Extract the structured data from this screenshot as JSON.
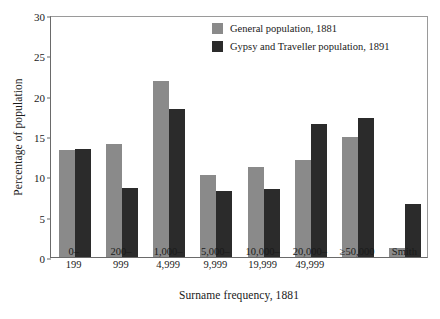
{
  "chart_data": {
    "type": "bar",
    "title": "",
    "xlabel": "Surname frequency, 1881",
    "ylabel": "Percentage of population",
    "ylim": [
      0,
      30
    ],
    "yticks": [
      "0",
      "5",
      "10",
      "15",
      "20",
      "25",
      "30"
    ],
    "grid": false,
    "legend_position": "top-right",
    "categories": [
      "0–\n199",
      "200–\n999",
      "1,000–\n4,999",
      "5,000–\n9,999",
      "10,000–\n19,999",
      "20,000–\n49,999",
      "≥50,000",
      "Smith"
    ],
    "series": [
      {
        "name": "General population, 1881",
        "color": "#8a8a8a",
        "values": [
          13.3,
          14.0,
          21.8,
          10.2,
          11.1,
          12.0,
          14.9,
          1.1
        ]
      },
      {
        "name": "Gypsy and Traveller population, 1891",
        "color": "#2b2b2b",
        "values": [
          13.4,
          8.5,
          18.3,
          8.2,
          8.4,
          16.5,
          17.2,
          6.6
        ]
      }
    ]
  },
  "legend": {
    "items": [
      {
        "label": "General population, 1881",
        "swatch": "general"
      },
      {
        "label": "Gypsy and Traveller population, 1891",
        "swatch": "gypsy"
      }
    ]
  },
  "colors": {
    "general": "#8a8a8a",
    "gypsy": "#2b2b2b",
    "axis": "#6a6a6a",
    "frame": "#9a9a9a",
    "background": "#ffffff"
  }
}
